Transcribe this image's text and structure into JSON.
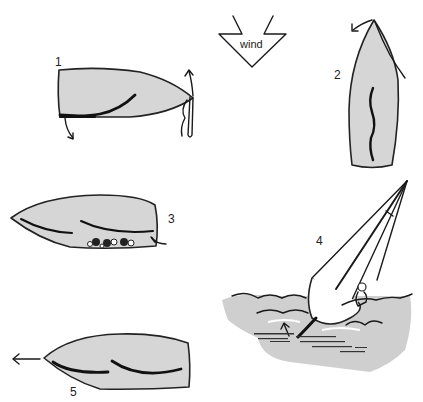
{
  "figure": {
    "type": "instructional sailing diagram",
    "wind_indicator": {
      "label": "wind",
      "direction": "down"
    },
    "steps": [
      {
        "number": "1",
        "description": "Hull viewed from above, rudder being removed/raised at stern with arrows"
      },
      {
        "number": "2",
        "description": "Hull pointing into wind, bow line rotated with curved arrow"
      },
      {
        "number": "3",
        "description": "Hull with mooring/buoyancy items tied near stern"
      },
      {
        "number": "4",
        "description": "Dinghy heeled over in water, centreboard in shallows, arrow"
      },
      {
        "number": "5",
        "description": "Hull moving left with motion arrow"
      }
    ]
  },
  "colors": {
    "hull_fill": "#d6d6d6",
    "line": "#1a1a1a",
    "water": "#cfcfcf",
    "background": "#ffffff"
  }
}
